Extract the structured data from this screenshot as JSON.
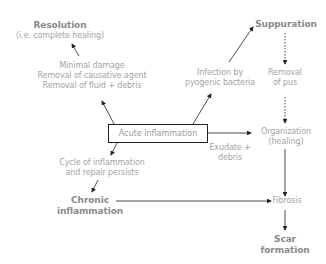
{
  "diagram": {
    "central_box": {
      "label": "Acute inflammation"
    },
    "nodes": {
      "resolution": {
        "title": "Resolution",
        "subtitle": "(i.e. complete healing)"
      },
      "suppuration": {
        "title": "Suppuration"
      },
      "removal_of_pus": {
        "line1": "Removal",
        "line2": "of pus"
      },
      "organization": {
        "line1": "Organization",
        "line2": "(healing)"
      },
      "fibrosis": {
        "label": "Fibrosis"
      },
      "scar_formation": {
        "line1": "Scar",
        "line2": "formation"
      },
      "chronic_inflammation": {
        "line1": "Chronic",
        "line2": "inflammation"
      }
    },
    "edge_labels": {
      "to_resolution": {
        "line1": "Minimal damage",
        "line2": "Removal of causative agent",
        "line3": "Removal of fluid + debris"
      },
      "to_suppuration": {
        "line1": "Infection by",
        "line2": "pyogenic bacteria"
      },
      "to_organization": {
        "line1": "Exudate +",
        "line2": "debris"
      },
      "to_chronic": {
        "line1": "Cycle of inflammation",
        "line2": "and repair persists"
      }
    },
    "colors": {
      "arrow": "#222222",
      "text": "#a3a3a3",
      "bold_text": "#8a8a8a"
    }
  }
}
